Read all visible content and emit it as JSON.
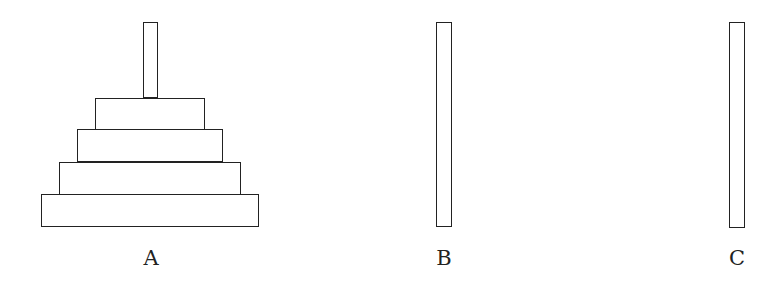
{
  "pegs": [
    {
      "label": "A",
      "x": 143,
      "y": 22,
      "w": 15,
      "h": 76,
      "label_x": 151,
      "label_y": 248,
      "disks": 4
    },
    {
      "label": "B",
      "x": 436,
      "y": 22,
      "w": 16,
      "h": 205,
      "label_x": 444,
      "label_y": 248,
      "disks": 0
    },
    {
      "label": "C",
      "x": 729,
      "y": 22,
      "w": 16,
      "h": 206,
      "label_x": 737,
      "label_y": 248,
      "disks": 0
    }
  ],
  "disks": [
    {
      "id": 1,
      "x": 95,
      "y": 98,
      "w": 110,
      "h": 32
    },
    {
      "id": 2,
      "x": 77,
      "y": 129,
      "w": 146,
      "h": 33
    },
    {
      "id": 3,
      "x": 59,
      "y": 162,
      "w": 182,
      "h": 33
    },
    {
      "id": 4,
      "x": 41,
      "y": 194,
      "w": 218,
      "h": 33
    }
  ],
  "colors": {
    "stroke": "#222222",
    "fill": "#ffffff"
  }
}
